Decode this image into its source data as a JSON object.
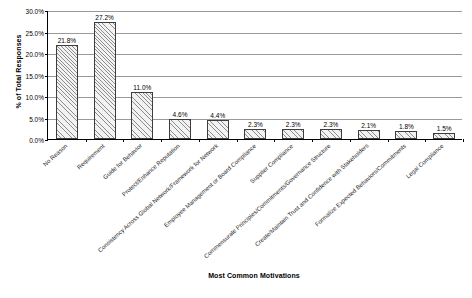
{
  "chart_data": {
    "type": "bar",
    "title": "",
    "xlabel": "Most Common Motivations",
    "ylabel": "% of Total Responses",
    "ylim": [
      0,
      30
    ],
    "ytick_labels": [
      "30.0%",
      "25.0%",
      "20.0%",
      "15.0%",
      "10.0%",
      "5.0%",
      "0.0%"
    ],
    "ytick_values": [
      30,
      25,
      20,
      15,
      10,
      5,
      0
    ],
    "grid": true,
    "legend": false,
    "categories": [
      "No Reason",
      "Requirement",
      "Guide for Behavior",
      "Protect/Enhance Reputation",
      "Consistency Across Global Network/Framework for Network",
      "Employee Management or Board Compliance",
      "Supplier Compliance",
      "Commensurate Principles/Commitments/Governance Structure",
      "Create/Maintain Trust and Confidence with Stakeholders",
      "Formalize Expected Behaviors/Commitments",
      "Legal Compliance"
    ],
    "values": [
      21.8,
      27.2,
      11.0,
      4.6,
      4.4,
      2.3,
      2.3,
      2.3,
      2.1,
      1.8,
      1.5
    ],
    "data_labels": [
      "21.8%",
      "27.2%",
      "11.0%",
      "4.6%",
      "4.4%",
      "2.3%",
      "2.3%",
      "2.3%",
      "2.1%",
      "1.8%",
      "1.5%"
    ],
    "bar_fill": "#f2f2f2",
    "bar_hatch_color": "#8d8d8d",
    "bar_edge_color": "#3d3d3d",
    "gridline_color": "#9a9a9a",
    "axis_color": "#000000",
    "background": "#ffffff"
  }
}
